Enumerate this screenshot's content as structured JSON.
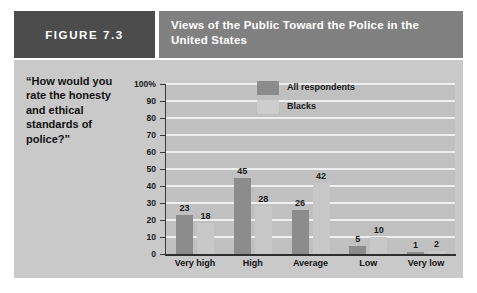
{
  "figure": {
    "badge_label": "FIGURE 7.3",
    "title": "Views of the Public Toward the Police in the United States",
    "question": "“How would you rate the honesty and ethical standards of police?”",
    "colors": {
      "badge_background": "#4c4c4c",
      "title_background": "#808080",
      "panel_background": "#c9c9c9",
      "plot_background": "#c0c0c0",
      "gridline": "#efefef",
      "series_all_respondents": "#8c8c8c",
      "series_blacks": "#c8c8c8"
    }
  },
  "chart_data": {
    "type": "bar",
    "title": "Views of the Public Toward the Police in the United States",
    "subtitle": "“How would you rate the honesty and ethical standards of police?”",
    "categories": [
      "Very high",
      "High",
      "Average",
      "Low",
      "Very low"
    ],
    "series": [
      {
        "name": "All respondents",
        "values": [
          23,
          45,
          26,
          5,
          1
        ]
      },
      {
        "name": "Blacks",
        "values": [
          18,
          28,
          42,
          10,
          2
        ]
      }
    ],
    "xlabel": "",
    "ylabel": "",
    "ylim": [
      0,
      100
    ],
    "yticks": [
      0,
      10,
      20,
      30,
      40,
      50,
      60,
      70,
      80,
      90,
      100
    ],
    "ytick_labels": [
      "0",
      "10",
      "20",
      "30",
      "40",
      "50",
      "60",
      "70",
      "80",
      "90",
      "100%"
    ],
    "grid": true,
    "legend_position": "top-center",
    "value_labels": true
  }
}
